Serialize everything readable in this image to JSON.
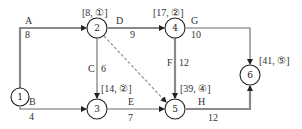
{
  "diagram": {
    "type": "activity-on-arrow network",
    "nodes": [
      {
        "id": "1",
        "label": "1",
        "annotation": ""
      },
      {
        "id": "2",
        "label": "2",
        "annotation": "[8, ①]"
      },
      {
        "id": "3",
        "label": "3",
        "annotation": "[14, ②]"
      },
      {
        "id": "4",
        "label": "4",
        "annotation": "[17, ②]"
      },
      {
        "id": "5",
        "label": "5",
        "annotation": "[39, ④]"
      },
      {
        "id": "6",
        "label": "6",
        "annotation": "[41, ⑤]"
      }
    ],
    "edges": [
      {
        "name": "A",
        "from": "1",
        "to": "2",
        "duration": "8",
        "style": "thick"
      },
      {
        "name": "B",
        "from": "1",
        "to": "3",
        "duration": "4",
        "style": "thin"
      },
      {
        "name": "C",
        "from": "2",
        "to": "3",
        "duration": "6",
        "style": "thin"
      },
      {
        "name": "D",
        "from": "2",
        "to": "4",
        "duration": "9",
        "style": "thick"
      },
      {
        "name": "",
        "from": "2",
        "to": "5",
        "duration": "",
        "style": "dashed"
      },
      {
        "name": "E",
        "from": "3",
        "to": "5",
        "duration": "7",
        "style": "thin"
      },
      {
        "name": "F",
        "from": "4",
        "to": "5",
        "duration": "12",
        "style": "thick"
      },
      {
        "name": "G",
        "from": "4",
        "to": "6",
        "duration": "10",
        "style": "thin"
      },
      {
        "name": "H",
        "from": "5",
        "to": "6",
        "duration": "12",
        "style": "thick"
      }
    ]
  }
}
